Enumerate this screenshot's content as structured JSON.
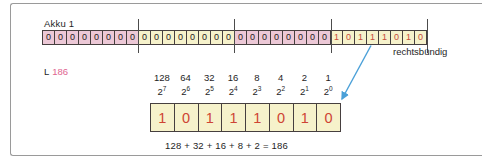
{
  "figure": {
    "accumulator": {
      "label": "Akku 1",
      "bytes": [
        {
          "bits": "00000000",
          "bg": "pink",
          "digit_color": "black"
        },
        {
          "bits": "00000000",
          "bg": "yellow",
          "digit_color": "black"
        },
        {
          "bits": "00000000",
          "bg": "pink",
          "digit_color": "black"
        },
        {
          "bits": "10111010",
          "bg": "yellow",
          "digit_color": "red"
        }
      ],
      "alignment_label": "rechtsbündig"
    },
    "instruction": {
      "opcode": "L",
      "operand": "186"
    },
    "decoder": {
      "place_values": [
        "128",
        "64",
        "32",
        "16",
        "8",
        "4",
        "2",
        "1"
      ],
      "powers": [
        {
          "base": "2",
          "exp": "7"
        },
        {
          "base": "2",
          "exp": "6"
        },
        {
          "base": "2",
          "exp": "5"
        },
        {
          "base": "2",
          "exp": "4"
        },
        {
          "base": "2",
          "exp": "3"
        },
        {
          "base": "2",
          "exp": "2"
        },
        {
          "base": "2",
          "exp": "1"
        },
        {
          "base": "2",
          "exp": "0"
        }
      ],
      "bits": [
        "1",
        "0",
        "1",
        "1",
        "1",
        "0",
        "1",
        "0"
      ],
      "sum_equation": "128 + 32 + 16 + 8 + 2 = 186"
    },
    "colors": {
      "byte_pink": "#ecc8d6",
      "byte_yellow": "#f6f2cb",
      "digit_red": "#c64b3b",
      "operand_pink": "#e0648f",
      "arrow_blue": "#4aa0d8",
      "frame_gray": "#9a9a9a"
    }
  }
}
